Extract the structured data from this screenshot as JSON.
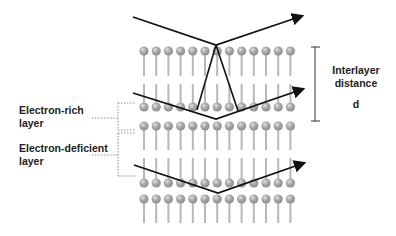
{
  "labels": {
    "electron_rich_line1": "Electron-rich",
    "electron_rich_line2": "layer",
    "electron_deficient_line1": "Electron-deficient",
    "electron_deficient_line2": "layer",
    "interlayer_line1": "Interlayer",
    "interlayer_line2": "distance",
    "interlayer_symbol": "d"
  },
  "structure": {
    "columns": 13,
    "rows": [
      {
        "orientation": "head-up",
        "head_y": 51,
        "tail_end_y": 76
      },
      {
        "orientation": "head-down",
        "head_y": 107,
        "tail_end_y": 84
      },
      {
        "orientation": "head-up",
        "head_y": 126,
        "tail_end_y": 150
      },
      {
        "orientation": "head-down",
        "head_y": 183,
        "tail_end_y": 158
      },
      {
        "orientation": "head-up",
        "head_y": 199,
        "tail_end_y": 223
      }
    ],
    "first_column_x": 144,
    "column_spacing": 12.2,
    "head_radius": 4.6,
    "head_color": "#9a9a9a",
    "head_highlight": "#d0d0d0",
    "tail_color": "#b8b8b8"
  },
  "rays": [
    {
      "name": "upper-ray",
      "points": [
        [
          133,
          17
        ],
        [
          216,
          45
        ],
        [
          302,
          16
        ]
      ]
    },
    {
      "name": "middle-ray",
      "points": [
        [
          133,
          93
        ],
        [
          216,
          119
        ],
        [
          303,
          89
        ]
      ]
    },
    {
      "name": "lower-ray",
      "points": [
        [
          134,
          165
        ],
        [
          218,
          193
        ],
        [
          304,
          163
        ]
      ]
    }
  ],
  "v_lines": {
    "apex": [
      216,
      45
    ],
    "left_end": [
      197,
      110
    ],
    "right_end": [
      238,
      111
    ]
  },
  "colors": {
    "ray": "#111111",
    "bracket": "#333333",
    "dashed": "#777777",
    "text": "#222222"
  }
}
